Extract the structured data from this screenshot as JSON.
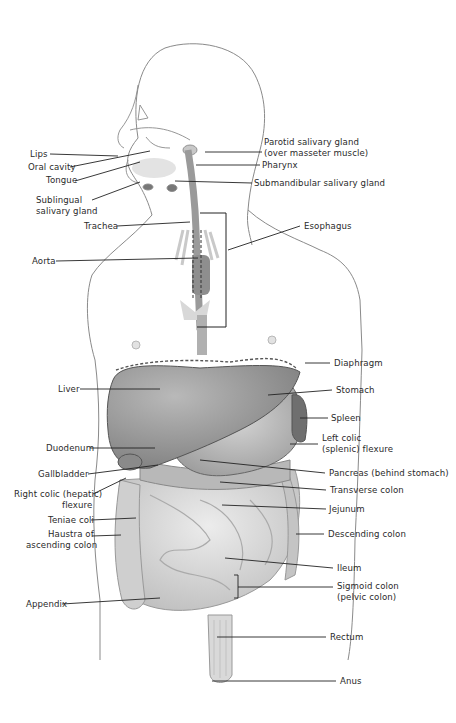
{
  "diagram": {
    "labels_left": [
      {
        "id": "lips",
        "text": "Lips",
        "x": 30,
        "y": 149
      },
      {
        "id": "oral-cavity",
        "text": "Oral cavity",
        "x": 28,
        "y": 162
      },
      {
        "id": "tongue",
        "text": "Tongue",
        "x": 46,
        "y": 175
      },
      {
        "id": "sublingual",
        "text": "Sublingual",
        "x": 36,
        "y": 195
      },
      {
        "id": "sublingual2",
        "text": "salivary gland",
        "x": 36,
        "y": 206
      },
      {
        "id": "trachea",
        "text": "Trachea",
        "x": 84,
        "y": 221
      },
      {
        "id": "aorta",
        "text": "Aorta",
        "x": 32,
        "y": 256
      },
      {
        "id": "liver",
        "text": "Liver",
        "x": 58,
        "y": 384
      },
      {
        "id": "duodenum",
        "text": "Duodenum",
        "x": 46,
        "y": 443
      },
      {
        "id": "gallbladder",
        "text": "Gallbladder",
        "x": 38,
        "y": 470
      },
      {
        "id": "right-colic",
        "text": "Right colic (hepatic)",
        "x": 14,
        "y": 490
      },
      {
        "id": "right-colic2",
        "text": "flexure",
        "x": 62,
        "y": 501
      },
      {
        "id": "teniae",
        "text": "Teniae coli",
        "x": 48,
        "y": 515
      },
      {
        "id": "haustra",
        "text": "Haustra of",
        "x": 48,
        "y": 529
      },
      {
        "id": "haustra2",
        "text": "ascending colon",
        "x": 26,
        "y": 540
      },
      {
        "id": "appendix",
        "text": "Appendix",
        "x": 26,
        "y": 599
      }
    ],
    "labels_right": [
      {
        "id": "parotid",
        "text": "Parotid salivary gland",
        "x": 264,
        "y": 137
      },
      {
        "id": "parotid2",
        "text": "(over masseter muscle)",
        "x": 264,
        "y": 148
      },
      {
        "id": "pharynx",
        "text": "Pharynx",
        "x": 262,
        "y": 160
      },
      {
        "id": "submandibular",
        "text": "Submandibular salivary gland",
        "x": 254,
        "y": 179
      },
      {
        "id": "esophagus",
        "text": "Esophagus",
        "x": 304,
        "y": 221
      },
      {
        "id": "diaphragm",
        "text": "Diaphragm",
        "x": 334,
        "y": 359
      },
      {
        "id": "stomach",
        "text": "Stomach",
        "x": 336,
        "y": 386
      },
      {
        "id": "spleen",
        "text": "Spleen",
        "x": 331,
        "y": 414
      },
      {
        "id": "left-colic",
        "text": "Left colic",
        "x": 322,
        "y": 434
      },
      {
        "id": "left-colic2",
        "text": "(splenic) flexure",
        "x": 322,
        "y": 445
      },
      {
        "id": "pancreas",
        "text": "Pancreas (behind stomach)",
        "x": 329,
        "y": 469
      },
      {
        "id": "transverse",
        "text": "Transverse colon",
        "x": 330,
        "y": 486
      },
      {
        "id": "jejunum",
        "text": "Jejunum",
        "x": 329,
        "y": 505
      },
      {
        "id": "descending",
        "text": "Descending colon",
        "x": 328,
        "y": 529
      },
      {
        "id": "ileum",
        "text": "Ileum",
        "x": 337,
        "y": 564
      },
      {
        "id": "sigmoid",
        "text": "Sigmoid colon",
        "x": 337,
        "y": 582
      },
      {
        "id": "sigmoid2",
        "text": "(pelvic colon)",
        "x": 337,
        "y": 592
      },
      {
        "id": "rectum",
        "text": "Rectum",
        "x": 330,
        "y": 632
      },
      {
        "id": "anus",
        "text": "Anus",
        "x": 340,
        "y": 676
      }
    ]
  }
}
